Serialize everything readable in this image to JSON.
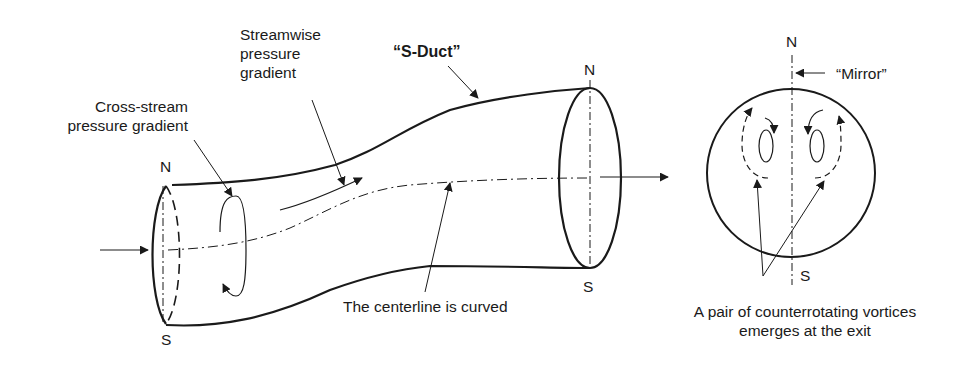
{
  "diagram": {
    "title": "S-Duct",
    "labels": {
      "sduct": "“S-Duct”",
      "streamwise_line1": "Streamwise",
      "streamwise_line2": "pressure",
      "streamwise_line3": "gradient",
      "crossstream_line1": "Cross-stream",
      "crossstream_line2": "pressure gradient",
      "centerline": "The centerline is curved",
      "mirror": "“Mirror”",
      "vortices_line1": "A pair of counterrotating vortices",
      "vortices_line2": "emerges at the exit"
    },
    "poles": {
      "inlet_north": "N",
      "inlet_south": "S",
      "exit_north": "N",
      "exit_south": "S",
      "section_north": "N",
      "section_south": "S"
    },
    "colors": {
      "ink": "#1a1a1a",
      "background": "#ffffff"
    }
  }
}
